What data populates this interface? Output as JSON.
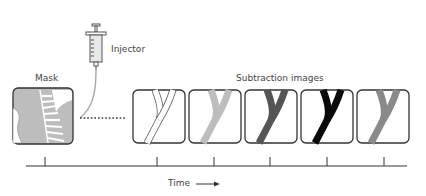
{
  "labels": {
    "injector": "Injector",
    "mask": "Mask",
    "subtraction": "Subtraction images",
    "time": "Time"
  },
  "frames": [
    {
      "id": "frame-1",
      "vessel_fill": "#ffffff",
      "vessel_stroke": "#555555"
    },
    {
      "id": "frame-2",
      "vessel_fill": "#bdbdbd",
      "vessel_stroke": "#777777"
    },
    {
      "id": "frame-3",
      "vessel_fill": "#555555",
      "vessel_stroke": "#444444"
    },
    {
      "id": "frame-4",
      "vessel_fill": "#0a0a0a",
      "vessel_stroke": "#000000"
    },
    {
      "id": "frame-5",
      "vessel_fill": "#8a8a8a",
      "vessel_stroke": "#777777"
    }
  ],
  "timeline": {
    "tick_count": 6
  }
}
